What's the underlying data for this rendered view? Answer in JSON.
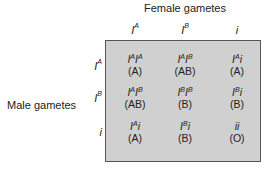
{
  "labels": {
    "female": "Female gametes",
    "male": "Male gametes"
  },
  "columns": [
    {
      "base": "I",
      "sup": "A"
    },
    {
      "base": "I",
      "sup": "B"
    },
    {
      "base": "i",
      "sup": ""
    }
  ],
  "rows": [
    {
      "base": "I",
      "sup": "A"
    },
    {
      "base": "I",
      "sup": "B"
    },
    {
      "base": "i",
      "sup": ""
    }
  ],
  "cells": [
    [
      {
        "g": [
          {
            "b": "I",
            "s": "A"
          },
          {
            "b": "I",
            "s": "A"
          }
        ],
        "phenotype": "(A)"
      },
      {
        "g": [
          {
            "b": "I",
            "s": "A"
          },
          {
            "b": "I",
            "s": "B"
          }
        ],
        "phenotype": "(AB)"
      },
      {
        "g": [
          {
            "b": "I",
            "s": "A"
          },
          {
            "b": "i",
            "s": ""
          }
        ],
        "phenotype": "(A)"
      }
    ],
    [
      {
        "g": [
          {
            "b": "I",
            "s": "A"
          },
          {
            "b": "I",
            "s": "B"
          }
        ],
        "phenotype": "(AB)"
      },
      {
        "g": [
          {
            "b": "I",
            "s": "B"
          },
          {
            "b": "I",
            "s": "B"
          }
        ],
        "phenotype": "(B)"
      },
      {
        "g": [
          {
            "b": "I",
            "s": "B"
          },
          {
            "b": "i",
            "s": ""
          }
        ],
        "phenotype": "(B)"
      }
    ],
    [
      {
        "g": [
          {
            "b": "I",
            "s": "A"
          },
          {
            "b": "i",
            "s": ""
          }
        ],
        "phenotype": "(A)"
      },
      {
        "g": [
          {
            "b": "I",
            "s": "B"
          },
          {
            "b": "i",
            "s": ""
          }
        ],
        "phenotype": "(B)"
      },
      {
        "g": [
          {
            "b": "i",
            "s": ""
          },
          {
            "b": "i",
            "s": ""
          }
        ],
        "phenotype": "(O)"
      }
    ]
  ],
  "colors": {
    "box_fill": "#d0d0d0",
    "box_border": "#555555"
  }
}
